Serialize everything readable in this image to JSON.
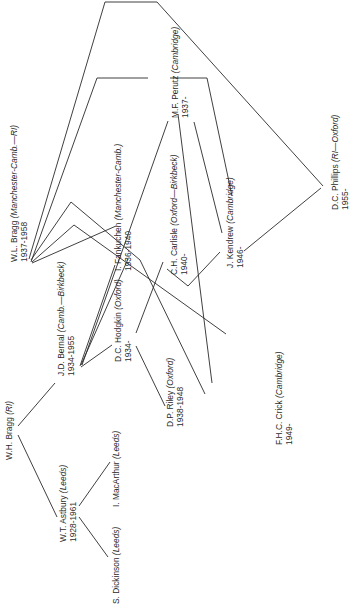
{
  "diagram": {
    "title": "",
    "orientation": "rotated-90-ccw",
    "line_color": "#2a2a2a",
    "nodes": [
      {
        "id": "wh_bragg",
        "name": "W.H. Bragg",
        "institution": "(RI)",
        "years": ""
      },
      {
        "id": "wl_bragg",
        "name": "W.L. Bragg",
        "institution": "(Manchester-Camb.—RI)",
        "years": "1937-1958"
      },
      {
        "id": "astbury",
        "name": "W.T. Astbury",
        "institution": "(Leeds)",
        "years": "1928-1961"
      },
      {
        "id": "bernal",
        "name": "J.D. Bernal",
        "institution": "(Camb.—Birkbeck)",
        "years": "1934-1955"
      },
      {
        "id": "dickinson",
        "name": "S. Dickinson",
        "institution": "(Leeds)",
        "years": ""
      },
      {
        "id": "macarthur",
        "name": "I. MacArthur",
        "institution": "(Leeds)",
        "years": ""
      },
      {
        "id": "hodgkin",
        "name": "D.C. Hodgkin",
        "institution": "(Oxford)",
        "years": "1934-"
      },
      {
        "id": "riley",
        "name": "D.P. Riley",
        "institution": "(Oxford)",
        "years": "1938-1948"
      },
      {
        "id": "fankuchen",
        "name": "I. Fankuchen",
        "institution": "(Manchester-Camb.)",
        "years": "1936-1940"
      },
      {
        "id": "carlisle",
        "name": "C.H. Carlisle",
        "institution": "(Oxford—Birkbeck)",
        "years": "1940-"
      },
      {
        "id": "perutz",
        "name": "M.F. Perutz",
        "institution": "(Cambridge)",
        "years": "1937-"
      },
      {
        "id": "kendrew",
        "name": "J. Kendrew",
        "institution": "(Cambridge)",
        "years": "1946-"
      },
      {
        "id": "crick",
        "name": "F.H.C. Crick",
        "institution": "(Cambridge)",
        "years": "1949-"
      },
      {
        "id": "phillips",
        "name": "D.C. Phillips",
        "institution": "(RI—Oxford)",
        "years": "1955-"
      }
    ],
    "edges": [
      [
        "wh_bragg",
        "astbury"
      ],
      [
        "wh_bragg",
        "bernal"
      ],
      [
        "astbury",
        "dickinson"
      ],
      [
        "astbury",
        "macarthur"
      ],
      [
        "bernal",
        "hodgkin"
      ],
      [
        "bernal",
        "fankuchen"
      ],
      [
        "bernal",
        "perutz"
      ],
      [
        "hodgkin",
        "riley"
      ],
      [
        "hodgkin",
        "carlisle"
      ],
      [
        "wl_bragg",
        "perutz"
      ],
      [
        "wl_bragg",
        "phillips"
      ],
      [
        "wl_bragg",
        "crick"
      ],
      [
        "wl_bragg",
        "kendrew"
      ],
      [
        "wl_bragg",
        "carlisle"
      ],
      [
        "perutz",
        "kendrew"
      ],
      [
        "perutz",
        "crick"
      ],
      [
        "carlisle",
        "kendrew"
      ],
      [
        "kendrew",
        "phillips"
      ]
    ]
  }
}
